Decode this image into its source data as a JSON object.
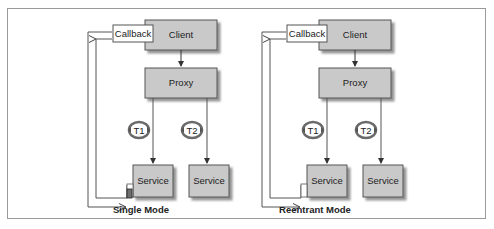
{
  "diagrams": [
    {
      "caption": "Single Mode",
      "callback": "Callback",
      "client": "Client",
      "proxy": "Proxy",
      "threads": [
        "T1",
        "T2"
      ],
      "services": [
        "Service",
        "Service"
      ],
      "lock_state": "locked"
    },
    {
      "caption": "Reentrant Mode",
      "callback": "Callback",
      "client": "Client",
      "proxy": "Proxy",
      "threads": [
        "T1",
        "T2"
      ],
      "services": [
        "Service",
        "Service"
      ],
      "lock_state": "unlocked"
    }
  ],
  "colors": {
    "box_fill": "#c9c9c9",
    "box_shadow": "#8a8a8a",
    "line": "#555555",
    "thread_ring": "#6a6a6a",
    "lock_fill": "#6f6f6f"
  }
}
